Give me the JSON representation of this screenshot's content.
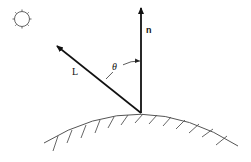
{
  "diagram": {
    "labels": {
      "normal": "n",
      "light": "L",
      "angle": "θ"
    },
    "elements": {
      "light_source": {
        "icon": "sun-icon",
        "cx": 22,
        "cy": 19,
        "r": 8
      },
      "origin": {
        "x": 141,
        "y": 113
      },
      "normal_vector": {
        "from": [
          141,
          113
        ],
        "to": [
          141,
          7
        ]
      },
      "light_vector": {
        "from": [
          141,
          113
        ],
        "to": [
          56,
          45
        ]
      },
      "angle_arc": {
        "from": [
          105,
          79
        ],
        "to": [
          140,
          60
        ]
      },
      "surface": {
        "start": [
          44,
          142
        ],
        "apex": [
          141,
          113
        ],
        "end": [
          238,
          145
        ]
      }
    },
    "colors": {
      "stroke": "#111111",
      "surface": "#555555",
      "sun": "#666666"
    }
  }
}
